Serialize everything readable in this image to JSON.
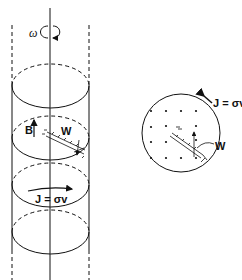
{
  "figure": {
    "left_panel": {
      "description": "Rotating cylinder with axis, magnetic field and wire",
      "labels": {
        "omega": "ω",
        "B": "B",
        "W": "W",
        "current": "J = σv"
      }
    },
    "right_panel": {
      "description": "Cross-section view with field dots and wire",
      "labels": {
        "current": "J = σv",
        "W": "W"
      }
    },
    "colors": {
      "ink": "#111111",
      "background": "#ffffff"
    }
  }
}
